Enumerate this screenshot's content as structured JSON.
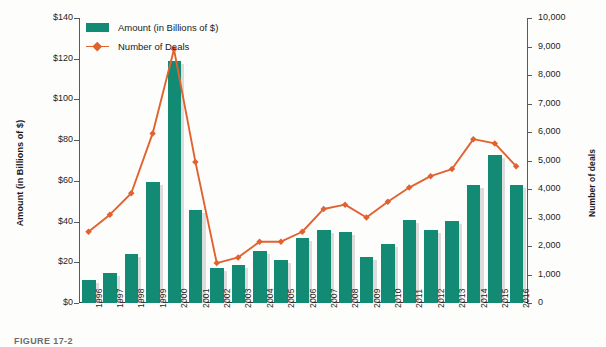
{
  "chart_data": {
    "type": "bar",
    "title": "",
    "xlabel": "",
    "ylabel": "Amount (in Billions of $)",
    "y2label": "Number of deals",
    "categories": [
      "1996",
      "1997",
      "1998",
      "1999",
      "2000",
      "2001",
      "2002",
      "2003",
      "2004",
      "2005",
      "2006",
      "2007",
      "2008",
      "2009",
      "2010",
      "2011",
      "2012",
      "2013",
      "2014",
      "2015",
      "2016"
    ],
    "ylim": [
      0,
      140
    ],
    "y2lim": [
      0,
      10000
    ],
    "yticks": [
      "$0",
      "$20",
      "$40",
      "$60",
      "$80",
      "$100",
      "$120",
      "$140"
    ],
    "ytick_values": [
      0,
      20,
      40,
      60,
      80,
      100,
      120,
      140
    ],
    "y2ticks": [
      "0",
      "1,000",
      "2,000",
      "3,000",
      "4,000",
      "5,000",
      "6,000",
      "7,000",
      "8,000",
      "9,000",
      "10,000"
    ],
    "y2tick_values": [
      0,
      1000,
      2000,
      3000,
      4000,
      5000,
      6000,
      7000,
      8000,
      9000,
      10000
    ],
    "grid": false,
    "legend_position": "top-left",
    "series": [
      {
        "name": "Amount (in Billions of $)",
        "type": "bar",
        "axis": "left",
        "color": "#128a74",
        "values": [
          11.5,
          14.8,
          24.2,
          59.5,
          119.0,
          45.8,
          17.0,
          18.8,
          25.6,
          21.2,
          31.8,
          35.8,
          35.0,
          22.5,
          29.2,
          40.8,
          36.0,
          40.5,
          58.0,
          72.5,
          58.0
        ]
      },
      {
        "name": "Number of Deals",
        "type": "line",
        "axis": "right",
        "color": "#e2622f",
        "values": [
          2500,
          3100,
          3850,
          5950,
          8900,
          4950,
          1400,
          1600,
          2150,
          2150,
          2500,
          3300,
          3450,
          3000,
          3550,
          4050,
          4450,
          4700,
          5750,
          5600,
          4800
        ]
      }
    ]
  },
  "legend": {
    "items": [
      {
        "label": "Amount (in Billions of $)",
        "marker": "swatch",
        "color": "#128a74"
      },
      {
        "label": "Number of Deals",
        "marker": "line-diamond",
        "color": "#e2622f"
      }
    ]
  },
  "caption": {
    "text": "FIGURE 17-2"
  }
}
